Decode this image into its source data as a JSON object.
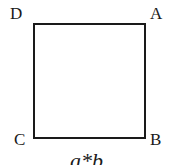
{
  "diagram": {
    "shape": "square",
    "vertices": [
      {
        "id": "D",
        "label": "D",
        "position": "top-left"
      },
      {
        "id": "A",
        "label": "A",
        "position": "top-right"
      },
      {
        "id": "C",
        "label": "C",
        "position": "bottom-left"
      },
      {
        "id": "B",
        "label": "B",
        "position": "bottom-right"
      }
    ],
    "caption": "a*b",
    "stroke_color": "#1a1a1a",
    "background_color": "#ffffff"
  }
}
